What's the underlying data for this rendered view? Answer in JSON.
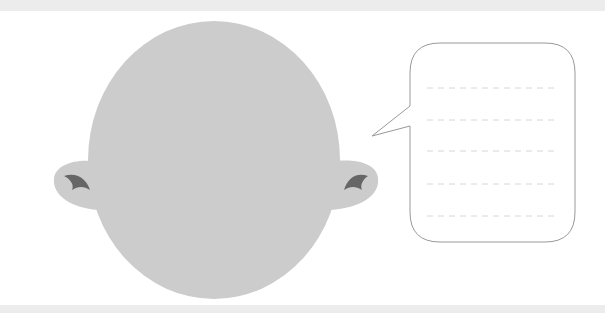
{
  "canvas": {
    "width": 605,
    "height": 313
  },
  "colors": {
    "background": "#ffffff",
    "strip": "#ececec",
    "head": "#cccccc",
    "ear_mark": "#666666",
    "bubble_stroke": "#999999",
    "dash_line": "#d6d6d6"
  },
  "figure": {
    "head": {
      "shape": "face-outline",
      "features": "blank"
    },
    "speech_bubble": {
      "lines": 5,
      "text": ""
    }
  }
}
